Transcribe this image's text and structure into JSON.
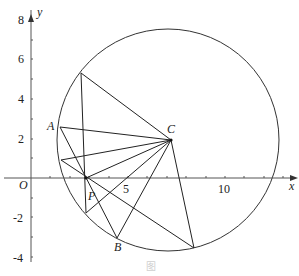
{
  "diagram": {
    "type": "coordinate-geometry",
    "axes": {
      "x_label": "x",
      "y_label": "y",
      "origin_label": "O",
      "x_tick_labels": [
        "5",
        "10"
      ],
      "y_tick_labels": [
        "8",
        "6",
        "4",
        "2",
        "-2",
        "-4"
      ]
    },
    "points": {
      "A": "A",
      "B": "B",
      "C": "C",
      "P": "P"
    },
    "caption": "图"
  }
}
